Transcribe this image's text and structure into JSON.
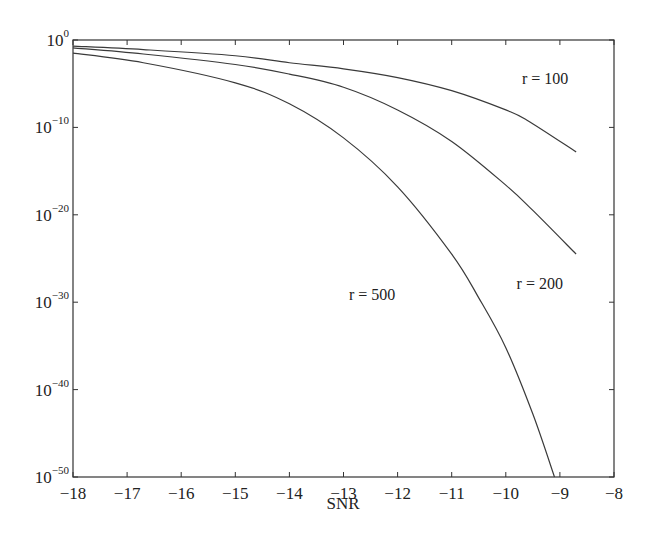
{
  "chart_data": {
    "type": "line",
    "title": "",
    "xlabel": "SNR",
    "ylabel": "",
    "xlim": [
      -18,
      -8
    ],
    "ylim_log10": [
      -50,
      0
    ],
    "yscale": "log",
    "grid": false,
    "legend": "none",
    "x_ticks": [
      -18,
      -17,
      -16,
      -15,
      -14,
      -13,
      -12,
      -11,
      -10,
      -9,
      -8
    ],
    "y_ticks": [
      {
        "base": "10",
        "exp": "0",
        "log10": 0
      },
      {
        "base": "10",
        "exp": "−10",
        "log10": -10
      },
      {
        "base": "10",
        "exp": "−20",
        "log10": -20
      },
      {
        "base": "10",
        "exp": "−30",
        "log10": -30
      },
      {
        "base": "10",
        "exp": "−40",
        "log10": -40
      },
      {
        "base": "10",
        "exp": "−50",
        "log10": -50
      }
    ],
    "series": [
      {
        "name": "r = 100",
        "x": [
          -18,
          -16.7,
          -15,
          -14,
          -13,
          -12,
          -11,
          -10,
          -9.6,
          -8.7
        ],
        "log10_y": [
          -0.7,
          -1.1,
          -1.8,
          -2.6,
          -3.3,
          -4.3,
          -5.8,
          -8.0,
          -9.2,
          -12.8
        ],
        "label_pos": {
          "x": -9.7,
          "log10_y": -5.0
        }
      },
      {
        "name": "r = 200",
        "x": [
          -18,
          -16.7,
          -15,
          -14,
          -13,
          -12,
          -11,
          -10,
          -9.5,
          -8.7
        ],
        "log10_y": [
          -0.9,
          -1.6,
          -2.8,
          -3.9,
          -5.4,
          -8.0,
          -11.6,
          -16.6,
          -19.5,
          -24.5
        ],
        "label_pos": {
          "x": -9.8,
          "log10_y": -28.5
        }
      },
      {
        "name": "r = 500",
        "x": [
          -18,
          -16.7,
          -15,
          -14,
          -13,
          -12,
          -11,
          -10.5,
          -10,
          -9.5,
          -9.1
        ],
        "log10_y": [
          -1.5,
          -2.6,
          -4.9,
          -7.3,
          -11.2,
          -16.8,
          -24.5,
          -29.5,
          -35.2,
          -42.8,
          -50
        ],
        "label_pos": {
          "x": -12.9,
          "log10_y": -29.8
        }
      }
    ]
  },
  "axes": {
    "xlabel": "SNR"
  }
}
